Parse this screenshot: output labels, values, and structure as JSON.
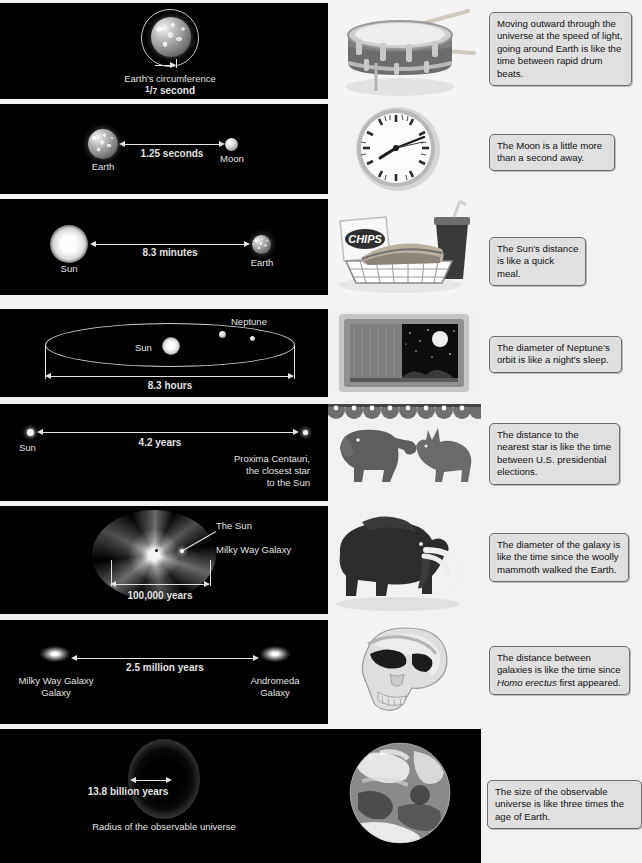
{
  "meta": {
    "panel_background": "#000000",
    "caption_background": "#e0e0e0",
    "caption_border": "#6e6e6e",
    "page_background": "#f2f2f2"
  },
  "rows": [
    {
      "id": "earth-circumference",
      "diagram": {
        "labels": [
          "Earth's circumference"
        ],
        "measure": "1/7 second",
        "measure_numerator": "1",
        "measure_denominator": "7",
        "measure_unit": "second",
        "objects": [
          "Earth",
          "orbit-ring"
        ]
      },
      "photo": {
        "name": "snare-drum-with-drumsticks-photo",
        "alt": "Snare drum with two drumsticks"
      },
      "caption": "Moving outward through the universe at the speed of light, going around Earth is like the time between rapid drum beats."
    },
    {
      "id": "earth-to-moon",
      "diagram": {
        "labels": [
          "Earth",
          "Moon"
        ],
        "measure": "1.25 seconds",
        "objects": [
          "Earth",
          "Moon"
        ]
      },
      "photo": {
        "name": "wall-clock-photo",
        "alt": "Round analog wall clock"
      },
      "caption": "The Moon is a little more than a second away."
    },
    {
      "id": "sun-to-earth",
      "diagram": {
        "labels": [
          "Sun",
          "Earth"
        ],
        "measure": "8.3 minutes",
        "objects": [
          "Sun",
          "Earth"
        ]
      },
      "photo": {
        "name": "quick-meal-basket-photo",
        "alt": "Chips bag, sandwich in basket and soda cup"
      },
      "caption": "The Sun's distance is like a quick meal."
    },
    {
      "id": "neptune-orbit",
      "diagram": {
        "labels": [
          "Sun",
          "Neptune"
        ],
        "measure": "8.3 hours",
        "objects": [
          "Sun",
          "Neptune",
          "orbit-ellipse"
        ]
      },
      "photo": {
        "name": "television-night-scene-photo",
        "alt": "Old television showing a moonlit night scene"
      },
      "caption": "The diameter of Neptune's orbit is like a night's sleep."
    },
    {
      "id": "sun-to-proxima",
      "diagram": {
        "labels": [
          "Sun",
          "Proxima Centauri,",
          "the closest star",
          "to the Sun"
        ],
        "label_right_block": "Proxima Centauri, the closest star to the Sun",
        "measure": "4.2 years",
        "objects": [
          "Sun",
          "Proxima Centauri"
        ]
      },
      "photo": {
        "name": "elephant-and-donkey-photo",
        "alt": "Republican elephant and Democratic donkey facing each other under bunting"
      },
      "caption": "The distance to the nearest star is like the time between U.S. presidential elections."
    },
    {
      "id": "milky-way-diameter",
      "diagram": {
        "labels": [
          "The Sun",
          "Milky Way Galaxy"
        ],
        "measure": "100,000 years",
        "objects": [
          "Milky Way Galaxy",
          "The Sun"
        ]
      },
      "photo": {
        "name": "woolly-mammoth-photo",
        "alt": "Woolly mammoth"
      },
      "caption": "The diameter of the galaxy is like the time since the woolly mammoth walked the Earth."
    },
    {
      "id": "milky-way-to-andromeda",
      "diagram": {
        "labels": [
          "Milky Way Galaxy",
          "Andromeda Galaxy"
        ],
        "label_left_block": "Milky Way\nGalaxy",
        "label_right_block": "Andromeda\nGalaxy",
        "measure": "2.5 million years",
        "objects": [
          "Milky Way Galaxy",
          "Andromeda Galaxy"
        ]
      },
      "photo": {
        "name": "homo-erectus-skull-photo",
        "alt": "Homo erectus skull"
      },
      "caption_parts": {
        "before": "The distance between galaxies is like the time since ",
        "italic": "Homo erectus",
        "after": " first appeared."
      },
      "caption": "The distance between galaxies is like the time since Homo erectus first appeared."
    },
    {
      "id": "observable-universe",
      "diagram": {
        "labels": [
          "Radius of the observable universe"
        ],
        "measure": "13.8 billion years",
        "objects": [
          "observable universe sphere"
        ]
      },
      "photo": {
        "name": "earth-from-space-photo",
        "alt": "Earth seen from space on black background"
      },
      "caption": "The size of the observable universe is like three times the age of Earth."
    }
  ]
}
